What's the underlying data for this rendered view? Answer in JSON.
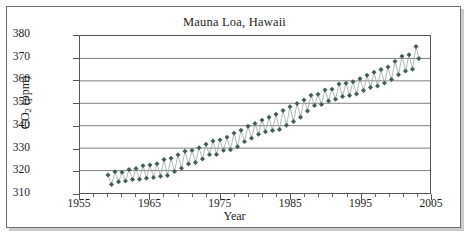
{
  "chart_data": {
    "type": "line",
    "title": "Mauna Loa, Hawaii",
    "xlabel": "Year",
    "ylabel": "CO2 (ppm)",
    "ylabel_parts": {
      "prefix": "CO",
      "sub": "2",
      "suffix": " (ppm)"
    },
    "xlim": [
      1955,
      2005
    ],
    "ylim": [
      310,
      380
    ],
    "ytick_labels": [
      "310",
      "320",
      "330",
      "340",
      "350",
      "360",
      "370",
      "380"
    ],
    "yticks": [
      310,
      320,
      330,
      340,
      350,
      360,
      370,
      380
    ],
    "xtick_labels": [
      "1955",
      "1965",
      "1975",
      "1985",
      "1995",
      "2005"
    ],
    "xticks": [
      1955,
      1965,
      1975,
      1985,
      1995,
      2005
    ],
    "xminor_step": 2,
    "grid": "horizontal",
    "legend": "none",
    "marker": "diamond",
    "marker_color": "#3f5f51",
    "line_color": "#9aa9a0",
    "grid_color": "#808080",
    "axis_color": "#555555",
    "frame_color": "#6e6e6e",
    "series": [
      {
        "name": "Monthly mean CO2",
        "x": [
          1959.0,
          1959.5,
          1960.0,
          1960.5,
          1961.0,
          1961.5,
          1962.0,
          1962.5,
          1963.0,
          1963.5,
          1964.0,
          1964.5,
          1965.0,
          1965.5,
          1966.0,
          1966.5,
          1967.0,
          1967.5,
          1968.0,
          1968.5,
          1969.0,
          1969.5,
          1970.0,
          1970.5,
          1971.0,
          1971.5,
          1972.0,
          1972.5,
          1973.0,
          1973.5,
          1974.0,
          1974.5,
          1975.0,
          1975.5,
          1976.0,
          1976.5,
          1977.0,
          1977.5,
          1978.0,
          1978.5,
          1979.0,
          1979.5,
          1980.0,
          1980.5,
          1981.0,
          1981.5,
          1982.0,
          1982.5,
          1983.0,
          1983.5,
          1984.0,
          1984.5,
          1985.0,
          1985.5,
          1986.0,
          1986.5,
          1987.0,
          1987.5,
          1988.0,
          1988.5,
          1989.0,
          1989.5,
          1990.0,
          1990.5,
          1991.0,
          1991.5,
          1992.0,
          1992.5,
          1993.0,
          1993.5,
          1994.0,
          1994.5,
          1995.0,
          1995.5,
          1996.0,
          1996.5,
          1997.0,
          1997.5,
          1998.0,
          1998.5,
          1999.0,
          1999.5,
          2000.0,
          2000.5,
          2001.0,
          2001.5,
          2002.0,
          2002.5,
          2003.0,
          2003.4
        ],
        "y": [
          318.0,
          313.8,
          319.5,
          315.0,
          319.2,
          315.3,
          320.5,
          316.0,
          320.9,
          316.1,
          322.2,
          316.6,
          322.5,
          316.9,
          323.0,
          317.5,
          324.9,
          317.8,
          325.5,
          319.6,
          327.0,
          321.0,
          328.6,
          322.9,
          329.0,
          323.6,
          330.2,
          325.2,
          331.7,
          327.1,
          333.2,
          327.2,
          333.7,
          329.0,
          334.9,
          329.3,
          336.7,
          330.6,
          338.0,
          332.9,
          339.8,
          334.4,
          341.0,
          336.2,
          342.5,
          337.3,
          343.8,
          337.9,
          345.1,
          338.3,
          346.8,
          340.2,
          348.5,
          341.9,
          349.9,
          343.8,
          351.5,
          346.6,
          353.6,
          349.0,
          354.0,
          349.5,
          355.9,
          351.0,
          356.3,
          351.8,
          358.6,
          353.0,
          358.9,
          353.5,
          359.6,
          354.1,
          360.9,
          355.7,
          362.5,
          357.0,
          363.8,
          357.7,
          365.1,
          359.0,
          366.2,
          360.6,
          368.7,
          362.7,
          371.0,
          364.4,
          371.6,
          365.2,
          375.3,
          370.0
        ]
      }
    ]
  }
}
